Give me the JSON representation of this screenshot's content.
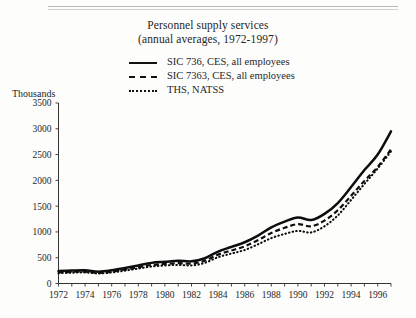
{
  "page": {
    "unit_label": "Thousands"
  },
  "chart_data": {
    "type": "line",
    "title": "Personnel supply services",
    "subtitle": "(annual averages, 1972-1997)",
    "xlabel": "",
    "ylabel": "Thousands",
    "xlim": [
      1972,
      1997
    ],
    "ylim": [
      0,
      3500
    ],
    "ytick_step": 500,
    "yticks": [
      0,
      500,
      1000,
      1500,
      2000,
      2500,
      3000,
      3500
    ],
    "xticks": [
      1972,
      1974,
      1976,
      1978,
      1980,
      1982,
      1984,
      1986,
      1988,
      1990,
      1992,
      1994,
      1996
    ],
    "xtick_labels": [
      "1972",
      "1974",
      "1976",
      "1978",
      "1980",
      "1982",
      "1984",
      "1986",
      "1988",
      "1990",
      "1992",
      "1994",
      "1996"
    ],
    "x": [
      1972,
      1973,
      1974,
      1975,
      1976,
      1977,
      1978,
      1979,
      1980,
      1981,
      1982,
      1983,
      1984,
      1985,
      1986,
      1987,
      1988,
      1989,
      1990,
      1991,
      1992,
      1993,
      1994,
      1995,
      1996,
      1997
    ],
    "grid": false,
    "legend_position": "top-center",
    "series": [
      {
        "name": "SIC 736, CES, all employees",
        "style": "solid",
        "values": [
          240,
          250,
          255,
          230,
          255,
          300,
          350,
          400,
          420,
          440,
          430,
          490,
          620,
          710,
          800,
          930,
          1090,
          1200,
          1280,
          1230,
          1350,
          1560,
          1870,
          2200,
          2500,
          2950
        ]
      },
      {
        "name": "SIC 7363, CES, all employees",
        "style": "dashed",
        "values": [
          215,
          225,
          230,
          205,
          230,
          270,
          315,
          360,
          380,
          395,
          385,
          440,
          560,
          640,
          720,
          840,
          980,
          1080,
          1150,
          1110,
          1220,
          1420,
          1700,
          1990,
          2260,
          2600
        ]
      },
      {
        "name": "THS, NATSS",
        "style": "dotted",
        "values": [
          200,
          210,
          215,
          195,
          215,
          250,
          290,
          330,
          350,
          360,
          350,
          400,
          510,
          580,
          650,
          760,
          880,
          960,
          1020,
          990,
          1110,
          1320,
          1620,
          1930,
          2230,
          2560
        ]
      }
    ]
  }
}
